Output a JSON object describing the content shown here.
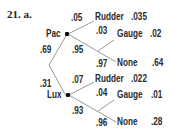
{
  "problem_label": "21. a.",
  "tree": {
    "root_branches": [
      {
        "prob": ".69",
        "node": "Pac",
        "branches": [
          {
            "prob": ".05",
            "outcome": "Rudder",
            "joint": ".035"
          },
          {
            "prob": ".95",
            "sub_branches": [
              {
                "prob": ".03",
                "outcome": "Gauge",
                "joint": ".02"
              },
              {
                "prob": ".97",
                "outcome": "None",
                "joint": ".64"
              }
            ]
          }
        ]
      },
      {
        "prob": ".31",
        "node": "Lux",
        "branches": [
          {
            "prob": ".07",
            "outcome": "Rudder",
            "joint": ".022"
          },
          {
            "prob": ".93",
            "sub_branches": [
              {
                "prob": ".04",
                "outcome": "Gauge",
                "joint": ".01"
              },
              {
                "prob": ".96",
                "outcome": "None",
                "joint": ".28"
              }
            ]
          }
        ]
      }
    ]
  },
  "colors": {
    "lines": "#9a9a9a",
    "text": "#2b2b2b",
    "node": "#111111"
  }
}
